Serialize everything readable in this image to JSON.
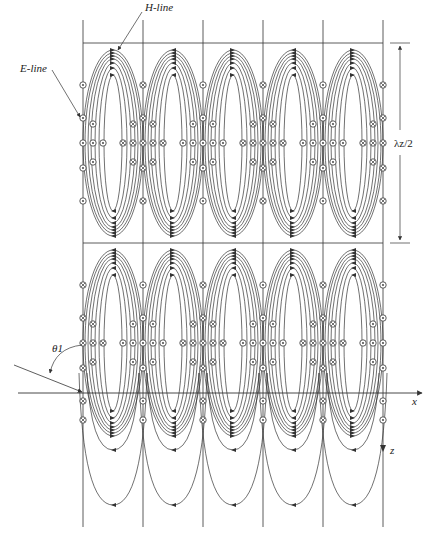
{
  "labels": {
    "h_line": "H-line",
    "e_line": "E-line",
    "wavelength": "λz/2",
    "theta": "θ1",
    "x_axis": "x",
    "z_axis": "z"
  },
  "geometry": {
    "boundaries_x": [
      83,
      143,
      203,
      263,
      323,
      383
    ],
    "top_line_y": 43,
    "mid_line_y": 243,
    "axis_y": 393,
    "vertical_top": 20,
    "vertical_bottom": 527,
    "upper_center_y": 143,
    "lower_center_y": 343
  },
  "field": {
    "ellipse_rx": [
      9,
      14,
      18,
      22,
      25,
      28,
      30
    ],
    "ellipse_ry": [
      68,
      75,
      80,
      84,
      87,
      90,
      93
    ],
    "upper_boundary_markers": [
      "dot",
      "cross",
      "dot",
      "cross",
      "dot",
      "cross"
    ],
    "lower_boundary_markers": [
      "cross",
      "dot",
      "cross",
      "dot",
      "cross",
      "dot"
    ]
  },
  "colors": {
    "line": "#333333",
    "background": "#ffffff"
  }
}
